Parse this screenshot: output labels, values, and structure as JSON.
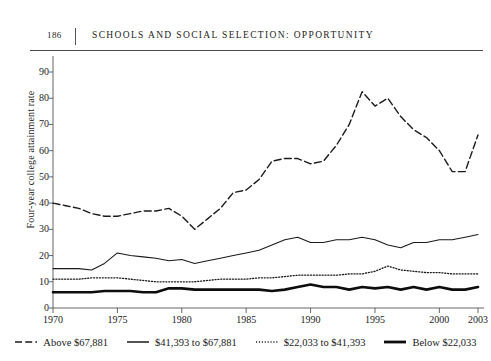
{
  "header": {
    "folio": "186",
    "title": "SCHOOLS AND SOCIAL SELECTION: OPPORTUNITY"
  },
  "chart_data": {
    "type": "line",
    "title": "",
    "xlabel": "",
    "ylabel": "Four-year college attainment rate",
    "xlim": [
      1970,
      2003
    ],
    "ylim": [
      0,
      90
    ],
    "grid": false,
    "legend_position": "bottom",
    "xticks": [
      "1970",
      "1975",
      "1980",
      "1985",
      "1990",
      "1995",
      "2000",
      "2003"
    ],
    "xtick_values": [
      1970,
      1975,
      1980,
      1985,
      1990,
      1995,
      2000,
      2003
    ],
    "yticks": [
      "0",
      "10",
      "20",
      "30",
      "40",
      "50",
      "60",
      "70",
      "80",
      "90"
    ],
    "ytick_values": [
      0,
      10,
      20,
      30,
      40,
      50,
      60,
      70,
      80,
      90
    ],
    "x": [
      1970,
      1971,
      1972,
      1973,
      1974,
      1975,
      1976,
      1977,
      1978,
      1979,
      1980,
      1981,
      1982,
      1983,
      1984,
      1985,
      1986,
      1987,
      1988,
      1989,
      1990,
      1991,
      1992,
      1993,
      1994,
      1995,
      1996,
      1997,
      1998,
      1999,
      2000,
      2001,
      2002,
      2003
    ],
    "series": [
      {
        "name": "Above $67,881",
        "style": "dashed",
        "width": 1.4,
        "color": "#1a1a1a",
        "values": [
          40,
          39,
          38,
          36,
          35,
          35,
          36,
          37,
          37,
          38,
          35,
          30,
          34,
          38,
          44,
          45,
          49,
          56,
          57,
          57,
          55,
          56,
          62,
          70,
          82.5,
          77,
          80,
          73,
          68,
          65,
          60,
          52,
          52,
          66
        ]
      },
      {
        "name": "$41,393 to $67,881",
        "style": "solid",
        "width": 1.1,
        "color": "#1a1a1a",
        "values": [
          15,
          15,
          15,
          14.5,
          17,
          21,
          20,
          19.5,
          19,
          18,
          18.5,
          17,
          18,
          19,
          20,
          21,
          22,
          24,
          26,
          27,
          25,
          25,
          26,
          26,
          27,
          26,
          24,
          23,
          25,
          25,
          26,
          26,
          27,
          28
        ]
      },
      {
        "name": "$22,033 to $41,393",
        "style": "dotted",
        "width": 1.3,
        "color": "#1a1a1a",
        "values": [
          11,
          11,
          11,
          11.5,
          11.5,
          11.5,
          11,
          10.5,
          10,
          10,
          10,
          10,
          10.5,
          11,
          11,
          11,
          11.5,
          11.5,
          12,
          12.5,
          12.5,
          12.5,
          12.5,
          13,
          13,
          14,
          16,
          14.5,
          14,
          13.5,
          13.5,
          13,
          13,
          13
        ]
      },
      {
        "name": "Below $22,033",
        "style": "thick",
        "width": 2.6,
        "color": "#0d0d0d",
        "values": [
          6,
          6,
          6,
          6,
          6.5,
          6.5,
          6.5,
          6,
          6,
          7.5,
          7.5,
          7,
          7,
          7,
          7,
          7,
          7,
          6.5,
          7,
          8,
          9,
          8,
          8,
          7,
          8,
          7.5,
          8,
          7,
          8,
          7,
          8,
          7,
          7,
          8
        ]
      }
    ]
  },
  "legend": {
    "items": [
      {
        "label": "Above $67,881",
        "style": "dashed"
      },
      {
        "label": "$41,393 to $67,881",
        "style": "solid"
      },
      {
        "label": "$22,033 to $41,393",
        "style": "dotted"
      },
      {
        "label": "Below $22,033",
        "style": "thick"
      }
    ]
  }
}
